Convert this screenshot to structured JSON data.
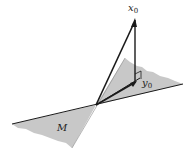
{
  "diagram": {
    "type": "vector-projection-onto-subspace",
    "labels": {
      "x0_base": "x",
      "x0_sub": "0",
      "y0_base": "y",
      "y0_sub": "0",
      "subspace": "M"
    },
    "colors": {
      "plane_fill": "#c8c8c8",
      "line": "#1a1a1a",
      "background": "#ffffff"
    },
    "points": {
      "origin": [
        96,
        105
      ],
      "x0_tip": [
        135,
        19
      ],
      "y0_tip": [
        135,
        82
      ]
    },
    "annotations": [
      "right-angle marker at y0"
    ]
  }
}
